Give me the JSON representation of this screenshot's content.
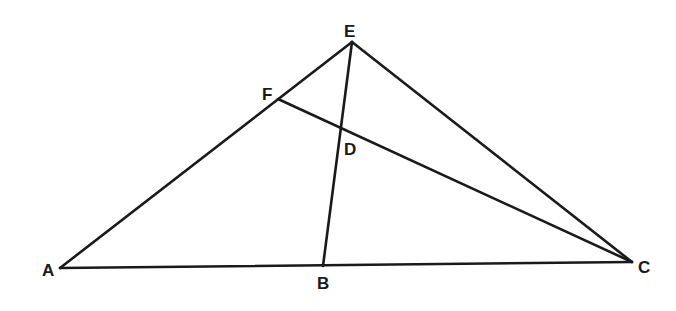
{
  "diagram": {
    "type": "geometry-triangle",
    "stroke_color": "#1a1a1a",
    "background": "#ffffff",
    "points": {
      "A": {
        "label": "A",
        "x": 60,
        "y": 268,
        "lx": 42,
        "ly": 276
      },
      "B": {
        "label": "B",
        "x": 323,
        "y": 266,
        "lx": 317,
        "ly": 289
      },
      "C": {
        "label": "C",
        "x": 632,
        "y": 262,
        "lx": 638,
        "ly": 273
      },
      "D": {
        "label": "D",
        "x": 342,
        "y": 128,
        "lx": 344,
        "ly": 155
      },
      "E": {
        "label": "E",
        "x": 352,
        "y": 42,
        "lx": 344,
        "ly": 37
      },
      "F": {
        "label": "F",
        "x": 278,
        "y": 99,
        "lx": 262,
        "ly": 100
      }
    },
    "segments": [
      {
        "name": "segment-AC",
        "from": "A",
        "to": "C"
      },
      {
        "name": "segment-AE",
        "from": "A",
        "to": "E"
      },
      {
        "name": "segment-EC",
        "from": "E",
        "to": "C"
      },
      {
        "name": "segment-EB",
        "from": "E",
        "to": "B"
      },
      {
        "name": "segment-FC",
        "from": "F",
        "to": "C"
      }
    ]
  }
}
